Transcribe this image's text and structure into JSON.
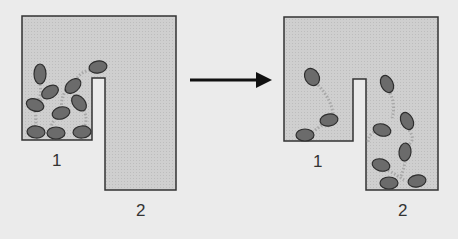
{
  "colors": {
    "background": "#ebebeb",
    "container_fill": "#cfcfcf",
    "outline": "#333333",
    "bacterium_fill": "#6b6b6b",
    "bacterium_stroke": "#2e2e2e",
    "trail": "#a8a8a8",
    "arrow": "#111111"
  },
  "diagram": {
    "before": {
      "labels": {
        "chamber1": "1",
        "chamber2": "2"
      },
      "cells": [
        {
          "cx": 40,
          "cy": 74,
          "rx": 6,
          "ry": 10,
          "rot": 0
        },
        {
          "cx": 98,
          "cy": 67,
          "rx": 9,
          "ry": 6,
          "rot": -10
        },
        {
          "cx": 50,
          "cy": 92,
          "rx": 9,
          "ry": 6,
          "rot": -30
        },
        {
          "cx": 73,
          "cy": 86,
          "rx": 9,
          "ry": 6,
          "rot": -40
        },
        {
          "cx": 35,
          "cy": 105,
          "rx": 9,
          "ry": 6,
          "rot": 20
        },
        {
          "cx": 79,
          "cy": 103,
          "rx": 6,
          "ry": 9,
          "rot": -40
        },
        {
          "cx": 61,
          "cy": 113,
          "rx": 9,
          "ry": 6,
          "rot": -15
        },
        {
          "cx": 36,
          "cy": 132,
          "rx": 9,
          "ry": 6,
          "rot": 5
        },
        {
          "cx": 56,
          "cy": 133,
          "rx": 9,
          "ry": 6,
          "rot": 0
        },
        {
          "cx": 82,
          "cy": 132,
          "rx": 9,
          "ry": 6,
          "rot": -5
        }
      ]
    },
    "after": {
      "labels": {
        "chamber1": "1",
        "chamber2": "2"
      },
      "cells": [
        {
          "cx": 312,
          "cy": 77,
          "rx": 7,
          "ry": 9,
          "rot": -30
        },
        {
          "cx": 329,
          "cy": 120,
          "rx": 9,
          "ry": 6,
          "rot": -10
        },
        {
          "cx": 305,
          "cy": 135,
          "rx": 9,
          "ry": 6,
          "rot": 0
        },
        {
          "cx": 387,
          "cy": 84,
          "rx": 6,
          "ry": 9,
          "rot": -25
        },
        {
          "cx": 382,
          "cy": 130,
          "rx": 9,
          "ry": 6,
          "rot": 15
        },
        {
          "cx": 407,
          "cy": 121,
          "rx": 6,
          "ry": 9,
          "rot": -25
        },
        {
          "cx": 405,
          "cy": 152,
          "rx": 6,
          "ry": 9,
          "rot": 5
        },
        {
          "cx": 381,
          "cy": 165,
          "rx": 9,
          "ry": 6,
          "rot": 15
        },
        {
          "cx": 389,
          "cy": 183,
          "rx": 9,
          "ry": 6,
          "rot": 0
        },
        {
          "cx": 417,
          "cy": 181,
          "rx": 9,
          "ry": 6,
          "rot": -10
        }
      ]
    },
    "arrow": {
      "x1": 190,
      "x2": 271,
      "y": 80,
      "direction": "right"
    }
  }
}
